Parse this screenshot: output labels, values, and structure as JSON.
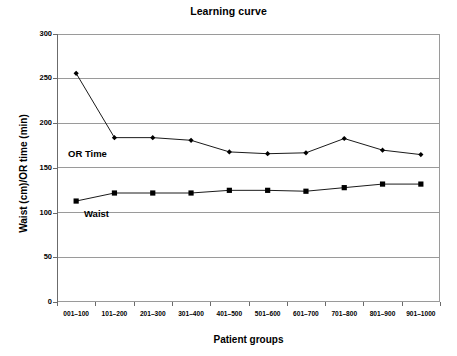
{
  "chart_data": {
    "type": "line",
    "title": "Learning curve",
    "xlabel": "Patient groups",
    "ylabel": "Waist (cm)/OR time (min)",
    "categories": [
      "001–100",
      "101–200",
      "201–300",
      "301–400",
      "401–500",
      "501–600",
      "601–700",
      "701–800",
      "801–900",
      "901–1000"
    ],
    "ylim": [
      0,
      300
    ],
    "yticks": [
      0,
      50,
      100,
      150,
      200,
      250,
      300
    ],
    "ytick_labels": [
      "0",
      "50",
      "100",
      "150",
      "200",
      "250",
      "300"
    ],
    "grid": true,
    "legend_position": "inline-annotation",
    "series": [
      {
        "name": "OR Time",
        "marker": "diamond",
        "color": "#000000",
        "values": [
          256,
          184,
          184,
          181,
          168,
          166,
          167,
          183,
          170,
          165
        ]
      },
      {
        "name": "Waist",
        "marker": "square",
        "color": "#000000",
        "values": [
          113,
          122,
          122,
          122,
          125,
          125,
          124,
          128,
          132,
          132
        ]
      }
    ],
    "annotations": [
      {
        "text": "OR Time",
        "series": "OR Time"
      },
      {
        "text": "Waist",
        "series": "Waist"
      }
    ]
  },
  "colors": {
    "axis": "#6b6b6b",
    "grid": "#9a9a9a",
    "data": "#000000",
    "background": "#ffffff"
  }
}
